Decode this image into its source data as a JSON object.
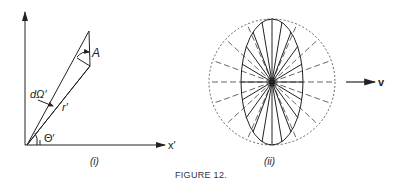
{
  "figure": {
    "caption": "FIGURE 12.",
    "panel_i": {
      "label": "(i)",
      "labels": {
        "A": "A",
        "d_omega": "dΩ′",
        "r": "r′",
        "theta": "Θ′",
        "x_axis": "x′"
      }
    },
    "panel_ii": {
      "label": "(ii)",
      "velocity_label": "v"
    },
    "colors": {
      "ink": "#222222",
      "dashed": "#555555",
      "background": "#ffffff"
    }
  }
}
